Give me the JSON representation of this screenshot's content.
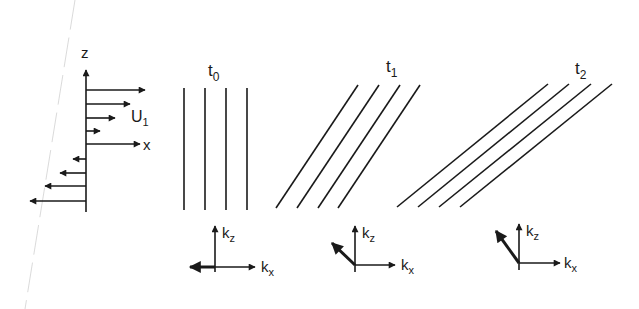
{
  "diagram": {
    "colors": {
      "ink": "#1a1a1a",
      "background": "#ffffff",
      "scan_artifact": "#c8c8c8"
    },
    "profile": {
      "axis_z_label": "z",
      "axis_x_label": "x",
      "velocity_label": "U",
      "velocity_subscript": "1"
    },
    "panels": [
      {
        "time_label": "t",
        "time_subscript": "0",
        "kz_label": "k",
        "kz_sub": "z",
        "kx_label": "k",
        "kx_sub": "x"
      },
      {
        "time_label": "t",
        "time_subscript": "1",
        "kz_label": "k",
        "kz_sub": "z",
        "kx_label": "k",
        "kx_sub": "x"
      },
      {
        "time_label": "t",
        "time_subscript": "2",
        "kz_label": "k",
        "kz_sub": "z",
        "kx_label": "k",
        "kx_sub": "x"
      }
    ]
  }
}
